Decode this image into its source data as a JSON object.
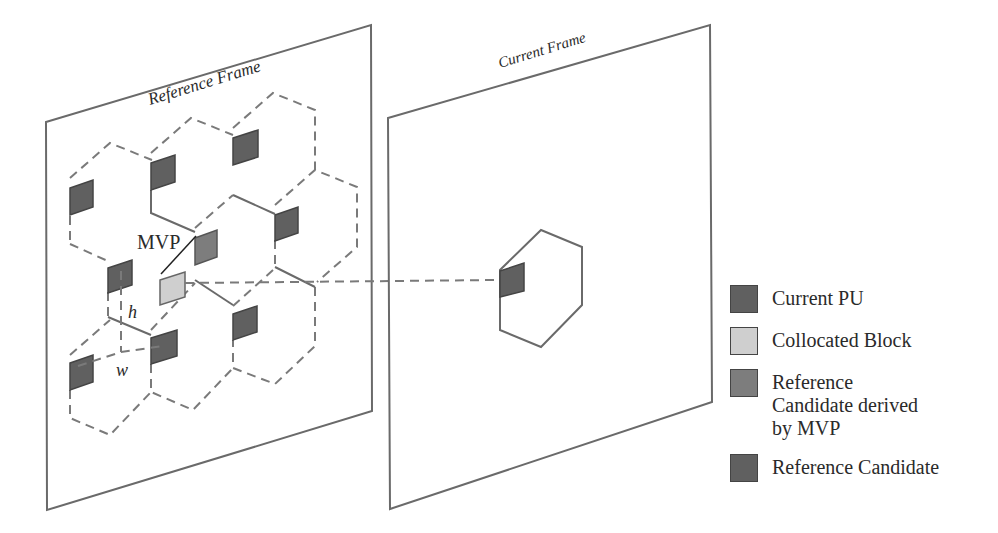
{
  "diagram": {
    "reference_frame": {
      "title": "Reference Frame"
    },
    "current_frame": {
      "title": "Current Frame"
    },
    "annotations": {
      "mvp": "MVP",
      "height": "h",
      "width": "w"
    }
  },
  "legend": {
    "items": [
      {
        "label": "Current PU",
        "color": "#606060"
      },
      {
        "label": "Collocated Block",
        "color": "#cfcfcf"
      },
      {
        "label": "Reference Candidate derived by MVP",
        "color": "#7d7d7d"
      },
      {
        "label": "Reference Candidate",
        "color": "#606060"
      }
    ]
  }
}
